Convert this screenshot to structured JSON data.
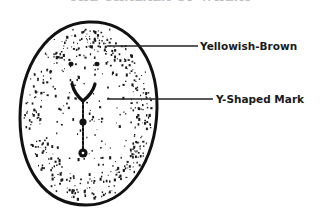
{
  "title": {
    "text": "THE CHALAZA OF WHEAT",
    "visible": "clipped at top edge, illegible"
  },
  "figure": {
    "shape": "egg-shaped outline with stippled interior",
    "outline_color": "#111111",
    "stipple_color": "#1a1a1a"
  },
  "labels": [
    {
      "id": "yellowish-brown",
      "text": "Yellowish-Brown"
    },
    {
      "id": "y-shaped-mark",
      "text": "Y-Shaped Mark"
    }
  ]
}
